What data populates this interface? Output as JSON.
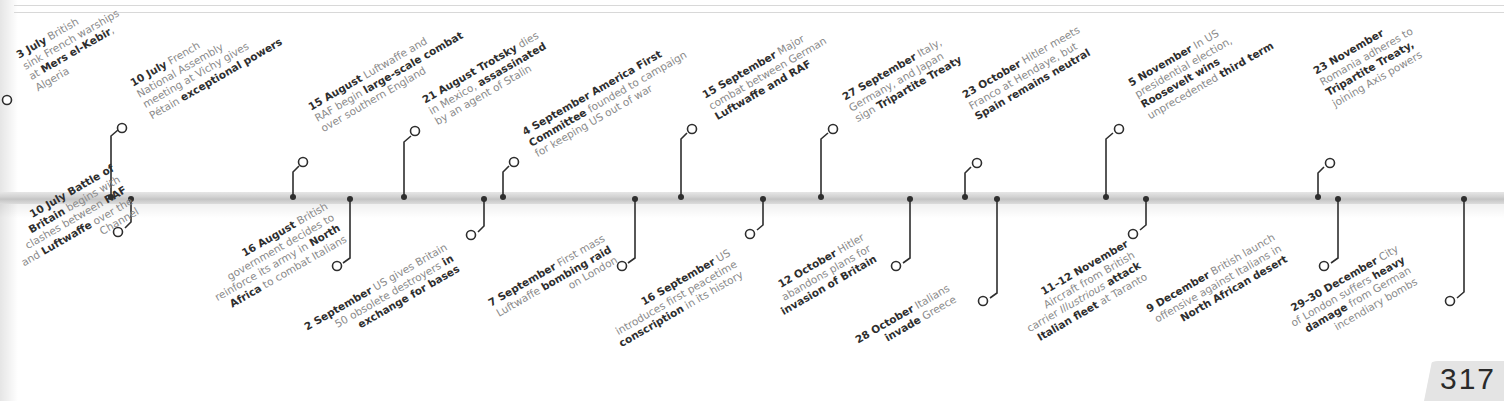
{
  "page": {
    "number": "317"
  },
  "timeline": {
    "events_above": [
      {
        "id": "3-july",
        "date": "3 July",
        "lines": [
          [
            {
              "t": "3 July",
              "b": true
            },
            {
              "t": " British"
            }
          ],
          [
            {
              "t": "sink French warships"
            }
          ],
          [
            {
              "t": "at "
            },
            {
              "t": "Mers el-Kebir",
              "b": true
            },
            {
              "t": ","
            }
          ],
          [
            {
              "t": "Algeria"
            }
          ]
        ]
      },
      {
        "id": "10-july-vichy",
        "date": "10 July",
        "lines": [
          [
            {
              "t": "10 July",
              "b": true
            },
            {
              "t": " French"
            }
          ],
          [
            {
              "t": "National Assembly"
            }
          ],
          [
            {
              "t": "meeting at Vichy gives"
            }
          ],
          [
            {
              "t": "Pétain "
            },
            {
              "t": "exceptional powers",
              "b": true
            }
          ]
        ]
      },
      {
        "id": "15-august",
        "date": "15 August",
        "lines": [
          [
            {
              "t": "15 August",
              "b": true
            },
            {
              "t": " Luftwaffe and"
            }
          ],
          [
            {
              "t": "RAF begin "
            },
            {
              "t": "large-scale combat",
              "b": true
            }
          ],
          [
            {
              "t": "over southern England"
            }
          ]
        ]
      },
      {
        "id": "21-august",
        "date": "21 August",
        "lines": [
          [
            {
              "t": "21 August Trotsky",
              "b": true
            },
            {
              "t": " dies"
            }
          ],
          [
            {
              "t": "in Mexico, "
            },
            {
              "t": "assassinated",
              "b": true
            }
          ],
          [
            {
              "t": "by an agent of Stalin"
            }
          ]
        ]
      },
      {
        "id": "4-september",
        "date": "4 September",
        "lines": [
          [
            {
              "t": "4 September America First",
              "b": true
            }
          ],
          [
            {
              "t": "Committee",
              "b": true
            },
            {
              "t": " founded to campaign"
            }
          ],
          [
            {
              "t": "for keeping US out of war"
            }
          ]
        ]
      },
      {
        "id": "15-september",
        "date": "15 September",
        "lines": [
          [
            {
              "t": "15 September",
              "b": true
            },
            {
              "t": " Major"
            }
          ],
          [
            {
              "t": "combat between German"
            }
          ],
          [
            {
              "t": "Luftwaffe and RAF",
              "b": true
            }
          ]
        ]
      },
      {
        "id": "27-september",
        "date": "27 September",
        "lines": [
          [
            {
              "t": "27 September",
              "b": true
            },
            {
              "t": " Italy,"
            }
          ],
          [
            {
              "t": "Germany, and Japan"
            }
          ],
          [
            {
              "t": "sign "
            },
            {
              "t": "Tripartite Treaty",
              "b": true
            }
          ]
        ]
      },
      {
        "id": "23-october",
        "date": "23 October",
        "lines": [
          [
            {
              "t": "23 October",
              "b": true
            },
            {
              "t": " Hitler meets"
            }
          ],
          [
            {
              "t": "Franco at Hendaye, but"
            }
          ],
          [
            {
              "t": "Spain remains neutral",
              "b": true
            }
          ]
        ]
      },
      {
        "id": "5-november",
        "date": "5 November",
        "lines": [
          [
            {
              "t": "5 November",
              "b": true
            },
            {
              "t": " In US"
            }
          ],
          [
            {
              "t": "presidential election,"
            }
          ],
          [
            {
              "t": "Roosevelt wins",
              "b": true
            }
          ],
          [
            {
              "t": "unprecedented "
            },
            {
              "t": "third term",
              "b": true
            }
          ]
        ]
      },
      {
        "id": "23-november",
        "date": "23 November",
        "lines": [
          [
            {
              "t": "23 November",
              "b": true
            }
          ],
          [
            {
              "t": "Romania adheres to"
            }
          ],
          [
            {
              "t": "Tripartite Treaty,",
              "b": true
            }
          ],
          [
            {
              "t": "joining Axis powers"
            }
          ]
        ]
      }
    ],
    "events_below": [
      {
        "id": "10-july-battle",
        "date": "10 July",
        "lines": [
          [
            {
              "t": "10 July Battle of",
              "b": true
            }
          ],
          [
            {
              "t": "Britain",
              "b": true
            },
            {
              "t": " begins with"
            }
          ],
          [
            {
              "t": "clashes between "
            },
            {
              "t": "RAF",
              "b": true
            }
          ],
          [
            {
              "t": "and "
            },
            {
              "t": "Luftwaffe",
              "b": true
            },
            {
              "t": " over the"
            }
          ],
          [
            {
              "t": "Channel"
            }
          ]
        ]
      },
      {
        "id": "16-august",
        "date": "16 August",
        "lines": [
          [
            {
              "t": "16 August",
              "b": true
            },
            {
              "t": " British"
            }
          ],
          [
            {
              "t": "government decides to"
            }
          ],
          [
            {
              "t": "reinforce its army in "
            },
            {
              "t": "North",
              "b": true
            }
          ],
          [
            {
              "t": "Africa",
              "b": true
            },
            {
              "t": " to combat Italians"
            }
          ]
        ]
      },
      {
        "id": "2-september",
        "date": "2 September",
        "lines": [
          [
            {
              "t": "2 September",
              "b": true
            },
            {
              "t": " US gives Britain"
            }
          ],
          [
            {
              "t": "50 obsolete destroyers "
            },
            {
              "t": "in",
              "b": true
            }
          ],
          [
            {
              "t": "exchange for bases",
              "b": true
            }
          ]
        ]
      },
      {
        "id": "7-september",
        "date": "7 September",
        "lines": [
          [
            {
              "t": "7 September",
              "b": true
            },
            {
              "t": " First mass"
            }
          ],
          [
            {
              "t": "Luftwaffe "
            },
            {
              "t": "bombing raid",
              "b": true
            }
          ],
          [
            {
              "t": "on London"
            }
          ]
        ]
      },
      {
        "id": "16-september",
        "date": "16 September",
        "lines": [
          [
            {
              "t": "16 September",
              "b": true
            },
            {
              "t": " US"
            }
          ],
          [
            {
              "t": "introduces first peacetime"
            }
          ],
          [
            {
              "t": "conscription",
              "b": true
            },
            {
              "t": " in its history"
            }
          ]
        ]
      },
      {
        "id": "12-october",
        "date": "12 October",
        "lines": [
          [
            {
              "t": "12 October",
              "b": true
            },
            {
              "t": " Hitler"
            }
          ],
          [
            {
              "t": "abandons plans for"
            }
          ],
          [
            {
              "t": "invasion of Britain",
              "b": true
            }
          ]
        ]
      },
      {
        "id": "28-october",
        "date": "28 October",
        "lines": [
          [
            {
              "t": "28 October",
              "b": true
            },
            {
              "t": " Italians"
            }
          ],
          [
            {
              "t": "invade",
              "b": true
            },
            {
              "t": " Greece"
            }
          ]
        ]
      },
      {
        "id": "11-12-november",
        "date": "11–12 November",
        "lines": [
          [
            {
              "t": "11–12 November",
              "b": true
            }
          ],
          [
            {
              "t": "Aircraft from British"
            }
          ],
          [
            {
              "t": "carrier "
            },
            {
              "t": "Illustrious",
              "i": true
            },
            {
              "t": " "
            },
            {
              "t": "attack",
              "b": true
            }
          ],
          [
            {
              "t": "Italian fleet",
              "b": true
            },
            {
              "t": " at Taranto"
            }
          ]
        ]
      },
      {
        "id": "9-december",
        "date": "9 December",
        "lines": [
          [
            {
              "t": "9 December",
              "b": true
            },
            {
              "t": " British launch"
            }
          ],
          [
            {
              "t": "offensive against Italians in"
            }
          ],
          [
            {
              "t": "North African desert",
              "b": true
            }
          ]
        ]
      },
      {
        "id": "29-30-december",
        "date": "29–30 December",
        "lines": [
          [
            {
              "t": "29–30 December",
              "b": true
            },
            {
              "t": " City"
            }
          ],
          [
            {
              "t": "of London suffers "
            },
            {
              "t": "heavy",
              "b": true
            }
          ],
          [
            {
              "t": "damage",
              "b": true
            },
            {
              "t": " from German"
            }
          ],
          [
            {
              "t": "incendiary bombs"
            }
          ]
        ]
      }
    ]
  },
  "colors": {
    "text_muted": "#8a8a8a",
    "text_bold": "#2e2e2e",
    "connector": "#2e2e2e",
    "bar": "#d0d0d0",
    "page_tab": "#e4e4e4"
  }
}
